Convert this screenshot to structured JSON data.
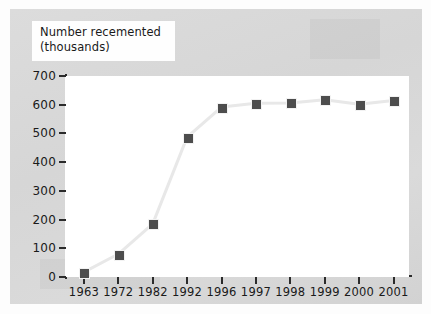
{
  "chart_data": {
    "type": "line",
    "title": "Number recemented (thousands)",
    "title_lines": [
      "Number recemented",
      "(thousands)"
    ],
    "xlabel": "",
    "ylabel": "Number recemented (thousands)",
    "categories": [
      "1963",
      "1972",
      "1982",
      "1992",
      "1996",
      "1997",
      "1998",
      "1999",
      "2000",
      "2001"
    ],
    "values": [
      17,
      80,
      185,
      487,
      592,
      605,
      606,
      617,
      602,
      615
    ],
    "yticks": [
      0,
      100,
      200,
      300,
      400,
      500,
      600,
      700
    ],
    "ytick_labels": [
      "0",
      "100",
      "200",
      "300",
      "400",
      "500",
      "600",
      "700"
    ],
    "ylim": [
      0,
      700
    ],
    "grid": false,
    "legend": null,
    "marker": "square",
    "marker_color": "#4d4d4d",
    "line_color": "#e8e8e8",
    "plot_background": "#ffffff",
    "figure_background": "#d9d9d9"
  },
  "colors": {
    "marker": "#4d4d4d",
    "line": "#e8e8e8",
    "axis": "#2b2b2b",
    "plot_bg": "#ffffff",
    "figure_bg": "#d9d9d9",
    "title_bg": "#fefefe",
    "text": "#1a1a1a"
  }
}
